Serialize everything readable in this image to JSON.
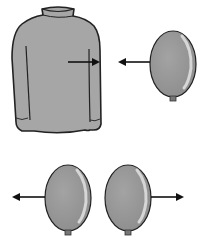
{
  "diagram": {
    "colors": {
      "sweater_fill": "#a6a6a6",
      "balloon_fill": "#9a9a9a",
      "outline": "#222222",
      "arrow": "#111111",
      "background": "#ffffff"
    },
    "objects": [
      {
        "id": "sweater",
        "type": "sweater-icon"
      },
      {
        "id": "balloon-top",
        "type": "balloon-icon"
      },
      {
        "id": "balloon-bottom-left",
        "type": "balloon-icon"
      },
      {
        "id": "balloon-bottom-right",
        "type": "balloon-icon"
      }
    ],
    "arrows": [
      {
        "from": "sweater",
        "direction": "right"
      },
      {
        "from": "balloon-top",
        "direction": "left"
      },
      {
        "from": "balloon-bottom-left",
        "direction": "left"
      },
      {
        "from": "balloon-bottom-right",
        "direction": "right"
      }
    ]
  }
}
